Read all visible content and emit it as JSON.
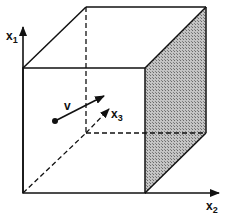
{
  "figure": {
    "type": "3d-cube-coordinate-diagram",
    "labels": {
      "axis1": "x",
      "axis1_sub": "1",
      "axis2": "x",
      "axis2_sub": "2",
      "axis3": "x",
      "axis3_sub": "3",
      "vector": "v"
    },
    "colors": {
      "line": "#111111",
      "shaded_face": "#9a9a9a",
      "background": "#ffffff"
    },
    "shaded_face": "right face (x2 = max)",
    "hidden_edges": "dashed"
  }
}
